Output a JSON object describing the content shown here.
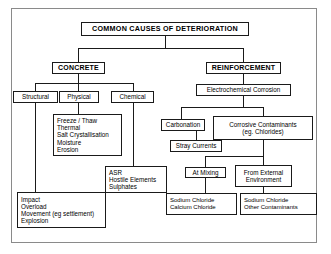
{
  "diagram": {
    "title": "COMMON CAUSES OF DETERIORATION",
    "type": "hierarchical-tree-flowchart",
    "border_color": "#8a8a8a",
    "node_border_color": "#1a1a1a",
    "background": "#ffffff",
    "nodes": {
      "root": "COMMON CAUSES OF DETERIORATION",
      "concrete": "CONCRETE",
      "reinforcement": "REINFORCEMENT",
      "structural": "Structural",
      "physical": "Physical",
      "chemical": "Chemical",
      "electrochemical_corrosion": "Electrochemical Corrosion",
      "carbonation": "Carbonation",
      "stray_currents": "Stray Currents",
      "at_mixing": "At Mixing"
    },
    "multiline_nodes": {
      "physical_details": [
        "Freeze / Thaw",
        "Thermal",
        "Salt Crystallisation",
        "Moisture",
        "Erosion"
      ],
      "chemical_details": [
        "ASR",
        "Hostile Elements",
        "Sulphates"
      ],
      "structural_details": [
        "Impact",
        "Overload",
        "Movement (eg settlement)",
        "Explosion"
      ],
      "corrosive_contaminants": [
        "Corrosive Contaminants",
        "(eg. Chlorides)"
      ],
      "from_external_environment": [
        "From External",
        "Environment"
      ],
      "at_mixing_contaminants": [
        "Sodium Chloride",
        "Calcium Chloride"
      ],
      "external_contaminants": [
        "Sodium Chloride",
        "Other Contaminants"
      ]
    }
  }
}
